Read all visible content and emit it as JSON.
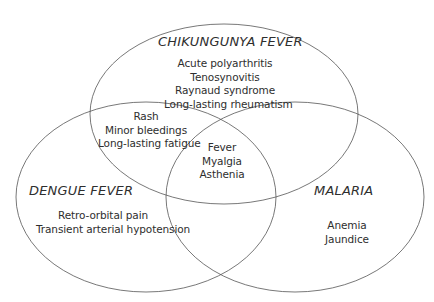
{
  "diagram": {
    "type": "venn",
    "sets": [
      {
        "id": "chikungunya",
        "title": "CHIKUNGUNYA FEVER",
        "items": [
          "Acute polyarthritis",
          "Tenosynovitis",
          "Raynaud syndrome",
          "Long-lasting rheumatism"
        ]
      },
      {
        "id": "dengue",
        "title": "DENGUE FEVER",
        "items": [
          "Retro-orbital pain",
          "Transient arterial hypotension"
        ]
      },
      {
        "id": "malaria",
        "title": "MALARIA",
        "items": [
          "Anemia",
          "Jaundice"
        ]
      }
    ],
    "intersections": {
      "chikungunya_dengue": [
        "Rash",
        "Minor bleedings",
        "Long-lasting fatigue"
      ],
      "all_three": [
        "Fever",
        "Myalgia",
        "Asthenia"
      ]
    },
    "stroke_color": "#555555"
  }
}
